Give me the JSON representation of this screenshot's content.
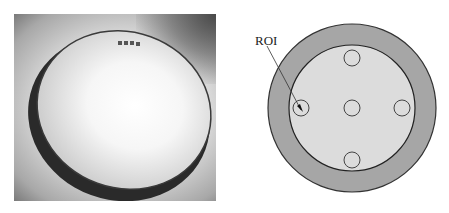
{
  "figure": {
    "left_panel": {
      "type": "photo",
      "subject": "lens-disk-photo",
      "lens_marking": "illegible small text on lens rim"
    },
    "right_panel": {
      "type": "schematic",
      "label": "ROI",
      "outer_ring_color": "#a6a6a6",
      "inner_disk_color": "#dcdcdc",
      "roi_circles": [
        {
          "name": "top",
          "cx": 127,
          "cy": 58
        },
        {
          "name": "left",
          "cx": 76,
          "cy": 108
        },
        {
          "name": "center",
          "cx": 127,
          "cy": 108
        },
        {
          "name": "right",
          "cx": 177,
          "cy": 108
        },
        {
          "name": "bottom",
          "cx": 127,
          "cy": 160
        }
      ]
    }
  }
}
